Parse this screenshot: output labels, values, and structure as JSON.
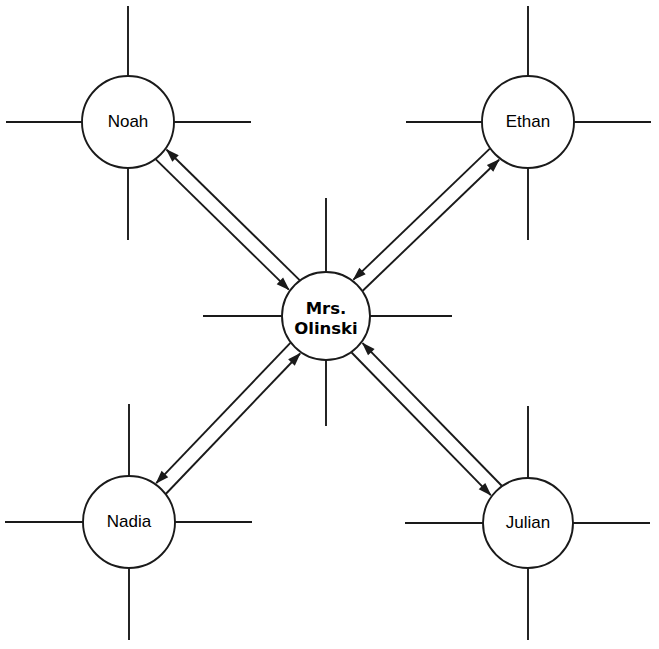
{
  "diagram": {
    "type": "radial-network",
    "background_color": "#ffffff",
    "line_color": "#1a1a1a",
    "width": 659,
    "height": 649,
    "center_node": {
      "id": "olinski",
      "label_line1": "Mrs.",
      "label_line2": "Olinski",
      "label_full": "Mrs. Olinski",
      "bold": true,
      "cx": 326,
      "cy": 316,
      "r": 44,
      "spokes": [
        {
          "name": "spoke-up",
          "angle_deg": 270,
          "length": 74
        },
        {
          "name": "spoke-down",
          "angle_deg": 90,
          "length": 66
        },
        {
          "name": "spoke-left",
          "angle_deg": 180,
          "length": 79
        },
        {
          "name": "spoke-right",
          "angle_deg": 0,
          "length": 82
        }
      ]
    },
    "outer_nodes": [
      {
        "id": "noah",
        "label": "Noah",
        "cx": 128,
        "cy": 122,
        "r": 46,
        "position": "top-left",
        "spokes": [
          {
            "name": "spoke-up",
            "angle_deg": 270,
            "length": 70
          },
          {
            "name": "spoke-down",
            "angle_deg": 90,
            "length": 72
          },
          {
            "name": "spoke-left",
            "angle_deg": 180,
            "length": 76
          },
          {
            "name": "spoke-right",
            "angle_deg": 0,
            "length": 77
          }
        ]
      },
      {
        "id": "ethan",
        "label": "Ethan",
        "cx": 528,
        "cy": 122,
        "r": 46,
        "position": "top-right",
        "spokes": [
          {
            "name": "spoke-up",
            "angle_deg": 270,
            "length": 70
          },
          {
            "name": "spoke-down",
            "angle_deg": 90,
            "length": 72
          },
          {
            "name": "spoke-left",
            "angle_deg": 180,
            "length": 76
          },
          {
            "name": "spoke-right",
            "angle_deg": 0,
            "length": 77
          }
        ]
      },
      {
        "id": "nadia",
        "label": "Nadia",
        "cx": 129,
        "cy": 522,
        "r": 46,
        "position": "bottom-left",
        "spokes": [
          {
            "name": "spoke-up",
            "angle_deg": 270,
            "length": 72
          },
          {
            "name": "spoke-down",
            "angle_deg": 90,
            "length": 72
          },
          {
            "name": "spoke-left",
            "angle_deg": 180,
            "length": 78
          },
          {
            "name": "spoke-right",
            "angle_deg": 0,
            "length": 77
          }
        ]
      },
      {
        "id": "julian",
        "label": "Julian",
        "cx": 528,
        "cy": 523,
        "r": 45,
        "position": "bottom-right",
        "spokes": [
          {
            "name": "spoke-up",
            "angle_deg": 270,
            "length": 72
          },
          {
            "name": "spoke-down",
            "angle_deg": 90,
            "length": 72
          },
          {
            "name": "spoke-left",
            "angle_deg": 180,
            "length": 78
          },
          {
            "name": "spoke-right",
            "angle_deg": 0,
            "length": 77
          }
        ]
      }
    ],
    "connections": [
      {
        "id": "olinski-noah",
        "from": "olinski",
        "to": "noah",
        "bidirectional": true,
        "style": "double-arrow-pair"
      },
      {
        "id": "olinski-ethan",
        "from": "olinski",
        "to": "ethan",
        "bidirectional": true,
        "style": "double-arrow-pair"
      },
      {
        "id": "olinski-nadia",
        "from": "olinski",
        "to": "nadia",
        "bidirectional": true,
        "style": "double-arrow-pair"
      },
      {
        "id": "olinski-julian",
        "from": "olinski",
        "to": "julian",
        "bidirectional": true,
        "style": "double-arrow-pair"
      }
    ]
  }
}
